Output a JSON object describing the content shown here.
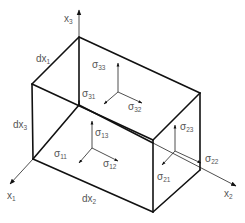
{
  "diagram": {
    "axes": [
      {
        "id": "x1",
        "base": "x",
        "sub": "1"
      },
      {
        "id": "x2",
        "base": "x",
        "sub": "2"
      },
      {
        "id": "x3",
        "base": "x",
        "sub": "3"
      }
    ],
    "dimensions": [
      {
        "id": "dx1",
        "base": "dx",
        "sub": "1"
      },
      {
        "id": "dx2",
        "base": "dx",
        "sub": "2"
      },
      {
        "id": "dx3",
        "base": "dx",
        "sub": "3"
      }
    ],
    "stresses": {
      "face3": [
        {
          "id": "s33",
          "base": "σ",
          "sub": "33"
        },
        {
          "id": "s31",
          "base": "σ",
          "sub": "31"
        },
        {
          "id": "s32",
          "base": "σ",
          "sub": "32"
        }
      ],
      "face1": [
        {
          "id": "s13",
          "base": "σ",
          "sub": "13"
        },
        {
          "id": "s11",
          "base": "σ",
          "sub": "11"
        },
        {
          "id": "s12",
          "base": "σ",
          "sub": "12"
        }
      ],
      "face2": [
        {
          "id": "s23",
          "base": "σ",
          "sub": "23"
        },
        {
          "id": "s22",
          "base": "σ",
          "sub": "22"
        },
        {
          "id": "s21",
          "base": "σ",
          "sub": "21"
        }
      ]
    },
    "colors": {
      "line": "#111111",
      "label": "#555555",
      "background": "#ffffff"
    }
  }
}
